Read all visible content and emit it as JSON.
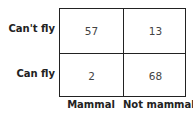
{
  "table": {
    "row_labels": [
      "Can't fly",
      "Can fly"
    ],
    "column_labels": [
      "Mammal",
      "Not mammal"
    ],
    "cells": [
      [
        "57",
        "13"
      ],
      [
        "2",
        "68"
      ]
    ]
  }
}
